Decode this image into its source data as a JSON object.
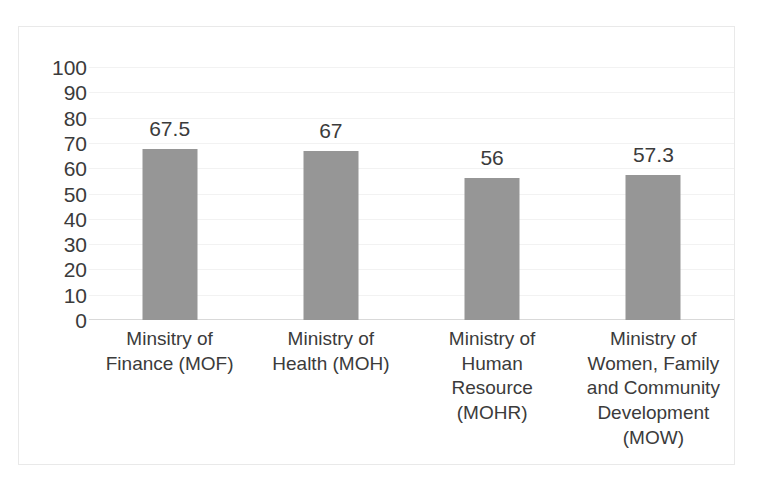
{
  "chart_data": {
    "type": "bar",
    "title": "",
    "subtitle": "",
    "xlabel": "",
    "ylabel": "",
    "ylim": [
      0,
      100
    ],
    "ytick_step": 10,
    "yticks": [
      "100",
      "90",
      "80",
      "70",
      "60",
      "50",
      "40",
      "30",
      "20",
      "10",
      "0"
    ],
    "grid": true,
    "legend": false,
    "legend_position": "none",
    "orientation": "vertical",
    "categories": [
      "Minsitry of Finance (MOF)",
      "Ministry of Health (MOH)",
      "Ministry of Human Resource (MOHR)",
      "Ministry of Women, Family and Community Development (MOW)"
    ],
    "category_lines": [
      [
        "Minsitry of",
        "Finance (MOF)"
      ],
      [
        "Ministry of",
        "Health (MOH)"
      ],
      [
        "Ministry of",
        "Human",
        "Resource",
        "(MOHR)"
      ],
      [
        "Ministry of",
        "Women, Family",
        "and Community",
        "Development",
        "(MOW)"
      ]
    ],
    "values": [
      67.5,
      67,
      56,
      57.3
    ],
    "data_labels": [
      "67.5",
      "67",
      "56",
      "57.3"
    ],
    "series": [
      {
        "name": "",
        "values": [
          67.5,
          67,
          56,
          57.3
        ]
      }
    ],
    "colors": {
      "bar": "#969696",
      "gridline": "#f2f2f2",
      "axis": "#d9d9d9",
      "frame": "#e9e9e9",
      "text": "#3b3b3b",
      "background": "#ffffff"
    }
  }
}
